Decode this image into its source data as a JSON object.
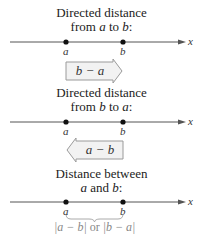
{
  "panels": [
    {
      "title_line1": "Directed distance",
      "title_line2_pre": "from ",
      "title_line2_var1": "a",
      "title_line2_mid": " to ",
      "title_line2_var2": "b",
      "title_line2_post": ":",
      "point_a": "a",
      "point_b": "b",
      "axis_label": "x",
      "expression": "b − a",
      "arrow_direction": "right"
    },
    {
      "title_line1": "Directed distance",
      "title_line2_pre": "from ",
      "title_line2_var1": "b",
      "title_line2_mid": " to ",
      "title_line2_var2": "a",
      "title_line2_post": ":",
      "point_a": "a",
      "point_b": "b",
      "axis_label": "x",
      "expression": "a − b",
      "arrow_direction": "left"
    },
    {
      "title_line1": "Distance between",
      "title_line2_var1": "a",
      "title_line2_mid": " and ",
      "title_line2_var2": "b",
      "title_line2_post": ":",
      "point_a": "a",
      "point_b": "b",
      "axis_label": "x",
      "expression_part1": "|a − b|",
      "expression_or": " or ",
      "expression_part2": "|b − a|"
    }
  ],
  "colors": {
    "arrow_fill": "#f2f2f2",
    "arrow_stroke": "#9a9a9a",
    "line": "#555555",
    "brace": "#aaaaaa"
  }
}
